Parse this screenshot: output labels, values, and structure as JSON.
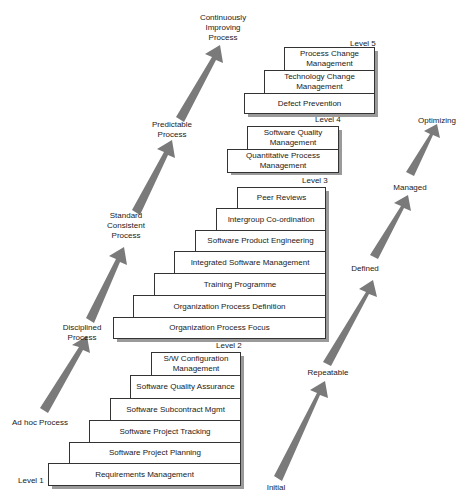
{
  "colors": {
    "arrow": "#7a7a7a",
    "box_border": "#333333",
    "shadow": "#9a9a9a",
    "text": "#1a1a1a"
  },
  "levels": {
    "level1": {
      "label": "Level 1"
    },
    "level2": {
      "label": "Level 2",
      "kpas": [
        "Requirements Management",
        "Software Project Planning",
        "Software Project Tracking",
        "Software Subcontract Mgmt",
        "Software Quality Assurance",
        "S/W Configuration Management"
      ]
    },
    "level3": {
      "label": "Level 3",
      "kpas": [
        "Organization Process Focus",
        "Organization Process Definition",
        "Training Programme",
        "Integrated Software Management",
        "Software Product Engineering",
        "Intergroup Co-ordination",
        "Peer Reviews"
      ]
    },
    "level4": {
      "label": "Level 4",
      "kpas": [
        "Quantitative Process Management",
        "Software Quality Management"
      ]
    },
    "level5": {
      "label": "Level 5",
      "kpas": [
        "Defect Prevention",
        "Technology Change Management",
        "Process Change Management"
      ]
    }
  },
  "process_characteristics": [
    "Ad hoc Process",
    "Disciplined Process",
    "Standard Consistent Process",
    "Predictable Process",
    "Continuously Improving Process"
  ],
  "maturity_levels": [
    "Initial",
    "Repeatable",
    "Defined",
    "Managed",
    "Optimizing"
  ]
}
